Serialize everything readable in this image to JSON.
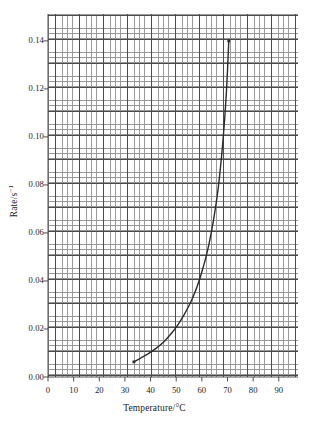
{
  "chart_data": {
    "type": "line",
    "title": "",
    "subtitle": "",
    "xlabel": "Temperature/°C",
    "ylabel": "Rate/s⁻¹",
    "ylabel_base": "Rate/s",
    "ylabel_exponent": "−1",
    "xlim": [
      0,
      97.5
    ],
    "ylim": [
      0.0,
      0.1512
    ],
    "xticks": [
      0,
      10,
      20,
      30,
      40,
      50,
      60,
      70,
      80,
      90
    ],
    "xticklabels": [
      "0",
      "10",
      "20",
      "30",
      "40",
      "50",
      "60",
      "70",
      "80",
      "90"
    ],
    "yticks": [
      0.0,
      0.02,
      0.04,
      0.06,
      0.08,
      0.1,
      0.12,
      0.14
    ],
    "yticklabels": [
      "0.00",
      "0.02",
      "0.04",
      "0.06",
      "0.08",
      "0.10",
      "0.12",
      "0.14"
    ],
    "grid": true,
    "grid_minor_step_x": 2,
    "grid_minor_step_y": 0.001,
    "grid_major_step_x": 10,
    "grid_major_step_y": 0.005,
    "legend": null,
    "legend_position": "none",
    "series": [
      {
        "name": "Rate vs temperature",
        "color": "#2b2b2b",
        "line_width": 1.4,
        "marker": "none",
        "endpoint_markers": true,
        "x": [
          33.5,
          36.0,
          39.0,
          42.0,
          45.0,
          48.0,
          50.5,
          53.0,
          55.5,
          57.5,
          59.5,
          61.5,
          63.0,
          64.5,
          66.0,
          67.0,
          68.0,
          69.0,
          69.8,
          70.5
        ],
        "y": [
          0.0063,
          0.0078,
          0.0096,
          0.0118,
          0.0145,
          0.018,
          0.0215,
          0.0258,
          0.0308,
          0.0358,
          0.042,
          0.0495,
          0.0565,
          0.065,
          0.0755,
          0.0845,
          0.0955,
          0.109,
          0.123,
          0.14
        ]
      }
    ],
    "annotations": []
  },
  "axis_colors": {
    "grid_minor": "#9a9a9a",
    "grid_major": "#4a4a4a",
    "axis_line": "#3a3a3a",
    "curve": "#2b2b2b",
    "text": "#1a1a1a",
    "background": "#ffffff"
  }
}
